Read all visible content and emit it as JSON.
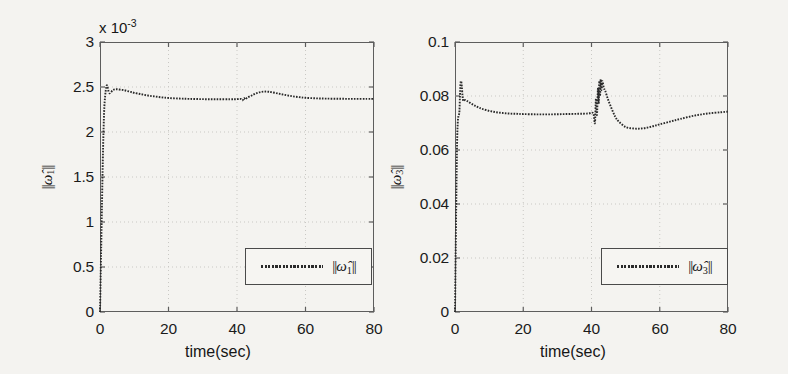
{
  "figure": {
    "background_color": "#f4f3f0",
    "line_color": "#2a2a2a",
    "axis_color": "#5d5d5d",
    "grid_color": "#c9c8c4"
  },
  "panels": [
    {
      "id": "left",
      "ylabel": "||ω̂1||",
      "ylabel_parts": {
        "bars_open": "||",
        "symbol": "ω̂",
        "subscript": "1",
        "bars_close": "||"
      },
      "multiplier_text": "x 10",
      "multiplier_exponent": "-3",
      "xlabel": "time(sec)",
      "yticks": [
        "0",
        "0.5",
        "1",
        "1.5",
        "2",
        "2.5",
        "3"
      ],
      "xticks": [
        "0",
        "20",
        "40",
        "60",
        "80"
      ],
      "legend_label": "||ω̂1||"
    },
    {
      "id": "right",
      "ylabel": "||ω̂3||",
      "ylabel_parts": {
        "bars_open": "||",
        "symbol": "ω̂",
        "subscript": "3",
        "bars_close": "||"
      },
      "multiplier_text": "",
      "multiplier_exponent": "",
      "xlabel": "time(sec)",
      "yticks": [
        "0",
        "0.02",
        "0.04",
        "0.06",
        "0.08",
        "0.1"
      ],
      "xticks": [
        "0",
        "20",
        "40",
        "60",
        "80"
      ],
      "legend_label": "||ω̂3||"
    }
  ],
  "chart_data": [
    {
      "type": "line",
      "id": "omega1-norm",
      "title": "",
      "xlabel": "time(sec)",
      "ylabel": "||ω̂1||",
      "y_multiplier": 0.001,
      "y_multiplier_label": "x 10^-3",
      "xlim": [
        0,
        80
      ],
      "ylim": [
        0,
        3
      ],
      "xticks": [
        0,
        20,
        40,
        60,
        80
      ],
      "yticks": [
        0,
        0.5,
        1,
        1.5,
        2,
        2.5,
        3
      ],
      "grid": true,
      "legend": [
        "||ω̂1||"
      ],
      "legend_position": "lower-right",
      "series": [
        {
          "name": "||ω̂1||",
          "style": "dotted-dense",
          "x": [
            0,
            0.3,
            0.6,
            0.9,
            1.2,
            1.5,
            1.8,
            2.0,
            2.2,
            2.5,
            2.8,
            3.2,
            3.6,
            4.0,
            4.5,
            5.0,
            6.0,
            7.0,
            8.0,
            9.0,
            10.0,
            12.0,
            14.0,
            16.0,
            18.0,
            20.0,
            23.0,
            26.0,
            30.0,
            34.0,
            38.0,
            40.0,
            41.0,
            41.6,
            42.0,
            42.4,
            43.0,
            44.0,
            45.0,
            46.0,
            47.0,
            48.0,
            49.0,
            50.0,
            52.0,
            54.0,
            56.0,
            58.0,
            60.0,
            63.0,
            66.0,
            70.0,
            74.0,
            78.0,
            80.0
          ],
          "y": [
            0.0,
            0.62,
            1.25,
            1.82,
            2.22,
            2.4,
            2.49,
            2.52,
            2.5,
            2.45,
            2.43,
            2.44,
            2.46,
            2.47,
            2.475,
            2.475,
            2.47,
            2.465,
            2.455,
            2.445,
            2.435,
            2.42,
            2.405,
            2.395,
            2.385,
            2.378,
            2.372,
            2.368,
            2.365,
            2.364,
            2.364,
            2.365,
            2.368,
            2.352,
            2.378,
            2.362,
            2.382,
            2.4,
            2.42,
            2.435,
            2.445,
            2.449,
            2.448,
            2.443,
            2.428,
            2.412,
            2.398,
            2.388,
            2.38,
            2.374,
            2.371,
            2.369,
            2.368,
            2.368,
            2.368
          ]
        }
      ]
    },
    {
      "type": "line",
      "id": "omega3-norm",
      "title": "",
      "xlabel": "time(sec)",
      "ylabel": "||ω̂3||",
      "y_multiplier": 1,
      "y_multiplier_label": "",
      "xlim": [
        0,
        80
      ],
      "ylim": [
        0,
        0.1
      ],
      "xticks": [
        0,
        20,
        40,
        60,
        80
      ],
      "yticks": [
        0,
        0.02,
        0.04,
        0.06,
        0.08,
        0.1
      ],
      "grid": true,
      "legend": [
        "||ω̂3||"
      ],
      "legend_position": "lower-right",
      "series": [
        {
          "name": "||ω̂3||",
          "style": "dotted-dense",
          "x": [
            0,
            0.2,
            0.4,
            0.6,
            0.8,
            1.0,
            1.15,
            1.3,
            1.45,
            1.6,
            1.8,
            2.0,
            2.2,
            2.4,
            2.6,
            3.0,
            3.5,
            4.0,
            5.0,
            6.0,
            7.0,
            8.0,
            10.0,
            12.0,
            14.0,
            16.0,
            18.0,
            20.0,
            24.0,
            28.0,
            32.0,
            36.0,
            39.0,
            40.5,
            41.0,
            41.3,
            41.6,
            41.9,
            42.1,
            42.3,
            42.5,
            42.7,
            42.9,
            43.2,
            43.6,
            44.0,
            44.5,
            45.0,
            46.0,
            47.0,
            48.0,
            50.0,
            52.0,
            54.0,
            56.0,
            58.0,
            60.0,
            63.0,
            66.0,
            70.0,
            74.0,
            78.0,
            80.0
          ],
          "y": [
            0.0,
            0.022,
            0.044,
            0.062,
            0.07,
            0.0725,
            0.073,
            0.0745,
            0.08,
            0.0845,
            0.0855,
            0.0835,
            0.08,
            0.0782,
            0.0784,
            0.0785,
            0.0782,
            0.0778,
            0.077,
            0.0763,
            0.0757,
            0.0752,
            0.0745,
            0.074,
            0.0737,
            0.0735,
            0.0734,
            0.0733,
            0.0732,
            0.0732,
            0.0733,
            0.0734,
            0.0735,
            0.0736,
            0.07,
            0.079,
            0.073,
            0.083,
            0.0772,
            0.0855,
            0.08,
            0.0862,
            0.0822,
            0.0855,
            0.083,
            0.082,
            0.08,
            0.0782,
            0.075,
            0.0722,
            0.0705,
            0.0685,
            0.068,
            0.0679,
            0.0682,
            0.0688,
            0.0695,
            0.0705,
            0.0715,
            0.0727,
            0.0735,
            0.074,
            0.0742
          ]
        }
      ]
    }
  ]
}
